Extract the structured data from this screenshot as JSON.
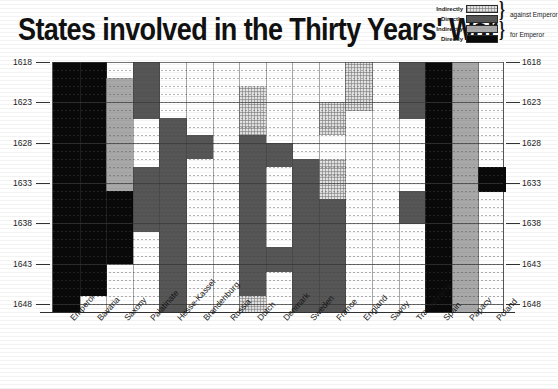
{
  "title": "States involved in the Thirty Years' War",
  "legend": {
    "rows": [
      {
        "label": "Indirectly",
        "swatch": "indirect-against"
      },
      {
        "label": "Directly",
        "swatch": "direct-against"
      },
      {
        "label": "Indirectly",
        "swatch": "indirect-for"
      },
      {
        "label": "Directly",
        "swatch": "direct-for"
      }
    ],
    "groups": [
      {
        "text": "against Emperor"
      },
      {
        "text": "for Emperor"
      }
    ]
  },
  "colors": {
    "indirect_against": "#e2e2e2",
    "direct_against": "#565656",
    "indirect_for": "#a8a8a8",
    "direct_for": "#090909",
    "background": "#ffffff",
    "axis": "#333333"
  },
  "chart_data": {
    "type": "heatmap",
    "title": "States involved in the Thirty Years' War",
    "xlabel": "",
    "ylabel": "",
    "ylim": [
      1618,
      1648
    ],
    "grid": true,
    "legend_position": "top-right",
    "y_ticks": [
      1618,
      1623,
      1628,
      1633,
      1638,
      1643,
      1648
    ],
    "y_ticks_right": [
      1618,
      1623,
      1628,
      1633,
      1638,
      1643,
      1648
    ],
    "years": [
      1618,
      1619,
      1620,
      1621,
      1622,
      1623,
      1624,
      1625,
      1626,
      1627,
      1628,
      1629,
      1630,
      1631,
      1632,
      1633,
      1634,
      1635,
      1636,
      1637,
      1638,
      1639,
      1640,
      1641,
      1642,
      1643,
      1644,
      1645,
      1646,
      1647,
      1648
    ],
    "categories": [
      "Emperor",
      "Bavaria",
      "Saxony",
      "Palatinate",
      "Hesse-Kassel",
      "Brandenburg",
      "Russia",
      "Dutch",
      "Denmark",
      "Sweden",
      "France",
      "England",
      "Savoy",
      "Transylvania",
      "Spain",
      "Papacy",
      "Poland"
    ],
    "value_key": {
      "0": "not involved",
      "1": "indirectly against Emperor",
      "2": "directly against Emperor",
      "3": "indirectly for Emperor",
      "4": "directly for Emperor"
    },
    "matrix": [
      [
        4,
        4,
        0,
        2,
        0,
        0,
        0,
        0,
        0,
        0,
        0,
        1,
        0,
        2,
        4,
        3,
        0
      ],
      [
        4,
        4,
        0,
        2,
        0,
        0,
        0,
        0,
        0,
        0,
        0,
        1,
        0,
        2,
        4,
        3,
        0
      ],
      [
        4,
        4,
        3,
        2,
        0,
        0,
        0,
        0,
        0,
        0,
        0,
        1,
        0,
        2,
        4,
        3,
        0
      ],
      [
        4,
        4,
        3,
        2,
        0,
        0,
        0,
        1,
        0,
        0,
        0,
        1,
        0,
        2,
        4,
        3,
        0
      ],
      [
        4,
        4,
        3,
        2,
        0,
        0,
        0,
        1,
        0,
        0,
        0,
        1,
        0,
        2,
        4,
        3,
        0
      ],
      [
        4,
        4,
        3,
        2,
        0,
        0,
        0,
        1,
        0,
        0,
        1,
        1,
        0,
        2,
        4,
        3,
        0
      ],
      [
        4,
        4,
        3,
        2,
        0,
        0,
        0,
        1,
        0,
        0,
        1,
        0,
        0,
        2,
        4,
        3,
        0
      ],
      [
        4,
        4,
        3,
        0,
        2,
        0,
        0,
        1,
        0,
        0,
        1,
        0,
        0,
        0,
        4,
        3,
        0
      ],
      [
        4,
        4,
        3,
        0,
        2,
        0,
        0,
        1,
        0,
        0,
        1,
        0,
        0,
        0,
        4,
        3,
        0
      ],
      [
        4,
        4,
        3,
        0,
        2,
        2,
        0,
        2,
        0,
        0,
        0,
        0,
        0,
        0,
        4,
        3,
        0
      ],
      [
        4,
        4,
        3,
        0,
        2,
        2,
        0,
        2,
        2,
        0,
        0,
        0,
        0,
        0,
        4,
        3,
        0
      ],
      [
        4,
        4,
        3,
        0,
        2,
        2,
        0,
        2,
        2,
        0,
        0,
        0,
        0,
        0,
        4,
        3,
        0
      ],
      [
        4,
        4,
        3,
        0,
        2,
        0,
        0,
        2,
        2,
        2,
        1,
        0,
        0,
        0,
        4,
        3,
        0
      ],
      [
        4,
        4,
        3,
        2,
        2,
        0,
        0,
        2,
        0,
        2,
        1,
        0,
        0,
        0,
        4,
        3,
        4
      ],
      [
        4,
        4,
        3,
        2,
        2,
        0,
        0,
        2,
        0,
        2,
        1,
        0,
        0,
        0,
        4,
        3,
        4
      ],
      [
        4,
        4,
        3,
        2,
        2,
        0,
        0,
        2,
        0,
        2,
        1,
        0,
        0,
        0,
        4,
        3,
        4
      ],
      [
        4,
        4,
        4,
        2,
        2,
        0,
        0,
        2,
        0,
        2,
        1,
        0,
        0,
        2,
        4,
        3,
        0
      ],
      [
        4,
        4,
        4,
        2,
        2,
        0,
        0,
        2,
        0,
        2,
        2,
        0,
        0,
        2,
        4,
        3,
        0
      ],
      [
        4,
        4,
        4,
        2,
        2,
        0,
        0,
        2,
        0,
        2,
        2,
        0,
        0,
        2,
        4,
        3,
        0
      ],
      [
        4,
        4,
        4,
        2,
        2,
        0,
        0,
        2,
        0,
        2,
        2,
        0,
        0,
        2,
        4,
        3,
        0
      ],
      [
        4,
        4,
        4,
        2,
        2,
        0,
        0,
        2,
        0,
        2,
        2,
        0,
        0,
        0,
        4,
        3,
        0
      ],
      [
        4,
        4,
        4,
        0,
        2,
        0,
        0,
        2,
        0,
        2,
        2,
        0,
        0,
        0,
        4,
        3,
        0
      ],
      [
        4,
        4,
        4,
        0,
        2,
        0,
        0,
        2,
        0,
        2,
        2,
        0,
        0,
        0,
        4,
        3,
        0
      ],
      [
        4,
        4,
        4,
        0,
        2,
        0,
        0,
        2,
        2,
        2,
        2,
        0,
        0,
        0,
        4,
        3,
        0
      ],
      [
        4,
        4,
        4,
        0,
        2,
        0,
        0,
        2,
        2,
        2,
        2,
        0,
        0,
        0,
        4,
        3,
        0
      ],
      [
        4,
        4,
        0,
        0,
        2,
        0,
        0,
        2,
        2,
        2,
        2,
        0,
        0,
        0,
        4,
        3,
        0
      ],
      [
        4,
        4,
        0,
        0,
        2,
        0,
        0,
        2,
        0,
        2,
        2,
        0,
        0,
        0,
        4,
        3,
        0
      ],
      [
        4,
        4,
        0,
        0,
        2,
        0,
        0,
        2,
        0,
        2,
        2,
        0,
        0,
        0,
        4,
        3,
        0
      ],
      [
        4,
        4,
        0,
        0,
        2,
        0,
        0,
        2,
        0,
        2,
        2,
        0,
        0,
        0,
        4,
        3,
        0
      ],
      [
        4,
        0,
        0,
        0,
        2,
        0,
        0,
        1,
        0,
        2,
        2,
        0,
        0,
        0,
        4,
        3,
        0
      ],
      [
        4,
        0,
        0,
        0,
        2,
        0,
        0,
        1,
        0,
        2,
        2,
        0,
        0,
        0,
        4,
        3,
        0
      ]
    ]
  }
}
